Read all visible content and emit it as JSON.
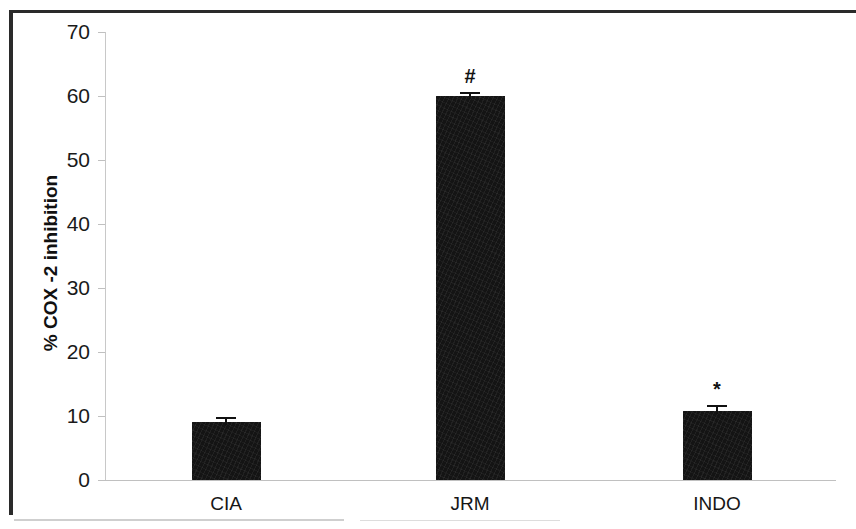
{
  "chart_data": {
    "type": "bar",
    "title": "",
    "xlabel": "",
    "ylabel": "% COX -2  inhibition",
    "categories": [
      "CIA",
      "JRM",
      "INDO"
    ],
    "values": [
      9.0,
      60.0,
      10.8
    ],
    "errors": [
      0.8,
      0.7,
      0.9
    ],
    "annotations": [
      "",
      "#",
      "*"
    ],
    "ylim": [
      0,
      70
    ],
    "yticks": [
      0,
      10,
      20,
      30,
      40,
      50,
      60,
      70
    ],
    "ytick_labels": [
      "0",
      "10",
      "20",
      "30",
      "40",
      "50",
      "60",
      "70"
    ],
    "grid": false,
    "legend": "none",
    "bar_color": "#141414",
    "axis_color": "#c8c8c8",
    "background_color": "#ffffff"
  },
  "axis": {
    "y_title": "% COX -2  inhibition"
  },
  "significance": {
    "jrm_marker": "#",
    "indo_marker": "*"
  }
}
